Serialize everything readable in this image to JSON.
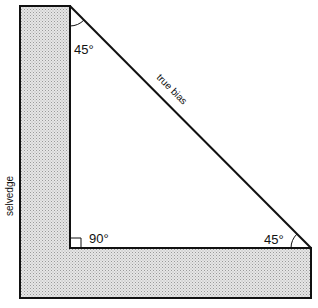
{
  "diagram": {
    "labels": {
      "top_angle": "45°",
      "bottom_right_angle": "45°",
      "right_angle": "90°",
      "hypotenuse": "true bias",
      "selvedge": "selvedge"
    },
    "colors": {
      "stroke": "#111111",
      "fill_pattern": "#bfbfbf",
      "background": "#ffffff"
    }
  }
}
